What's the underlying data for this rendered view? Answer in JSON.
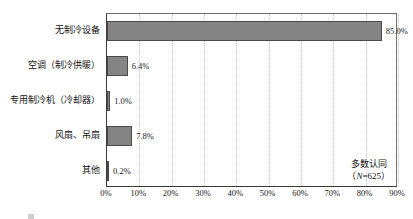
{
  "chart_data": {
    "type": "bar",
    "orientation": "horizontal",
    "title": "",
    "xlabel": "",
    "ylabel": "",
    "categories": [
      "无制冷设备",
      "空调（制冷供暖）",
      "专用制冷机（冷却器）",
      "风扇、吊扇",
      "其他"
    ],
    "values": [
      85.0,
      6.4,
      1.0,
      7.8,
      0.2
    ],
    "value_labels": [
      "85.0%",
      "6.4%",
      "1.0%",
      "7.8%",
      "0.2%"
    ],
    "xlim": [
      0,
      90
    ],
    "xticks": [
      0,
      10,
      20,
      30,
      40,
      50,
      60,
      70,
      80,
      90
    ],
    "xtick_labels": [
      "0%",
      "10%",
      "20%",
      "30%",
      "40%",
      "50%",
      "60%",
      "70%",
      "80%",
      "90%"
    ],
    "grid": "vertical-dotted",
    "legend": "none",
    "bar_color": "#848484",
    "bar_border_color": "#4a4a4a",
    "gridline_color": "#c9c9c9",
    "axis_color": "#3a3a3a",
    "annotations": [
      {
        "line1": "多数认同",
        "line2_prefix": "（",
        "line2_var": "N",
        "line2_suffix": "=625）"
      }
    ]
  },
  "annotation": {
    "note": "多数认同",
    "n_open": "（",
    "n_var": "N",
    "n_value": "=625）"
  },
  "caption": {
    "partial_text": ""
  }
}
